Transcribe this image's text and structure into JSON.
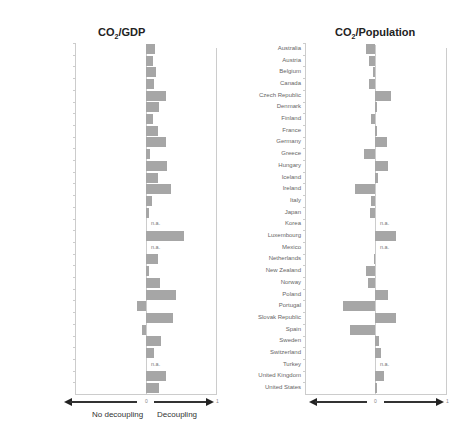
{
  "chart_data": [
    {
      "type": "bar",
      "orientation": "horizontal",
      "title": "CO2/GDP",
      "categories": [
        "Australia",
        "Austria",
        "Belgium",
        "Canada",
        "Czech Republic",
        "Denmark",
        "Finland",
        "France",
        "Germany",
        "Greece",
        "Hungary",
        "Iceland",
        "Ireland",
        "Italy",
        "Japan",
        "Korea",
        "Luxembourg",
        "Mexico",
        "Netherlands",
        "New Zealand",
        "Norway",
        "Poland",
        "Portugal",
        "Slovak Republic",
        "Spain",
        "Sweden",
        "Switzerland",
        "Turkey",
        "United Kingdom",
        "United States"
      ],
      "values": [
        0.13,
        0.1,
        0.14,
        0.11,
        0.29,
        0.19,
        0.1,
        0.17,
        0.29,
        0.06,
        0.3,
        0.17,
        0.36,
        0.09,
        0.04,
        null,
        0.54,
        null,
        0.17,
        0.04,
        0.2,
        0.43,
        -0.13,
        0.39,
        -0.06,
        0.21,
        0.12,
        null,
        0.29,
        0.18
      ],
      "na_label": "n.a.",
      "x_ticks": [
        "0",
        "1"
      ],
      "x_annotations": {
        "left": "No decoupling",
        "right": "Decoupling"
      },
      "xlim": [
        -1,
        1
      ],
      "grid": false
    },
    {
      "type": "bar",
      "orientation": "horizontal",
      "title": "CO2/Population",
      "categories": [
        "Australia",
        "Austria",
        "Belgium",
        "Canada",
        "Czech Republic",
        "Denmark",
        "Finland",
        "France",
        "Germany",
        "Greece",
        "Hungary",
        "Iceland",
        "Ireland",
        "Italy",
        "Japan",
        "Korea",
        "Luxembourg",
        "Mexico",
        "Netherlands",
        "New Zealand",
        "Norway",
        "Poland",
        "Portugal",
        "Slovak Republic",
        "Spain",
        "Sweden",
        "Switzerland",
        "Turkey",
        "United Kingdom",
        "United States"
      ],
      "values": [
        -0.12,
        -0.09,
        -0.03,
        -0.08,
        0.23,
        0.01,
        -0.06,
        0.01,
        0.17,
        -0.15,
        0.18,
        0.04,
        -0.28,
        -0.05,
        -0.07,
        null,
        0.3,
        null,
        -0.01,
        -0.13,
        -0.1,
        0.19,
        -0.45,
        0.29,
        -0.35,
        0.05,
        0.09,
        null,
        0.13,
        0.0
      ],
      "na_label": "n.a.",
      "x_ticks": [
        "0",
        "1"
      ],
      "xlim": [
        -1,
        1
      ],
      "grid": false
    }
  ],
  "charts": {
    "left": {
      "title_main": "CO",
      "title_sub": "2",
      "title_rest": "/GDP",
      "zero": "0",
      "one": "1",
      "left_caption": "No decoupling",
      "right_caption": "Decoupling"
    },
    "right": {
      "title_main": "CO",
      "title_sub": "2",
      "title_rest": "/Population",
      "zero": "0",
      "one": "1"
    }
  },
  "colors": {
    "bar": "#a6a6a6",
    "axis": "#cccccc",
    "arrow": "#222222"
  }
}
